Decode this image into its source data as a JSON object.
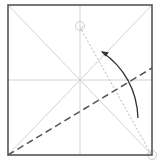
{
  "diagram": {
    "type": "origami-fold-step",
    "square": {
      "x": 8,
      "y": 5,
      "size": 144,
      "height": 150,
      "stroke": "#555555"
    },
    "crease_color": "#cfcfcf",
    "valley_fold_color": "#555555",
    "arrow_color": "#333333",
    "reference_dotted_color": "#bbbbbb",
    "marker_color": "#cccccc",
    "elements": [
      "paper-square-outline",
      "diagonal-crease-tl-br",
      "diagonal-crease-tr-bl",
      "horizontal-center-crease",
      "vertical-center-crease",
      "valley-fold-dashed-line",
      "fold-direction-arrow",
      "dotted-guide-line",
      "target-point-marker",
      "source-corner-marker"
    ]
  }
}
